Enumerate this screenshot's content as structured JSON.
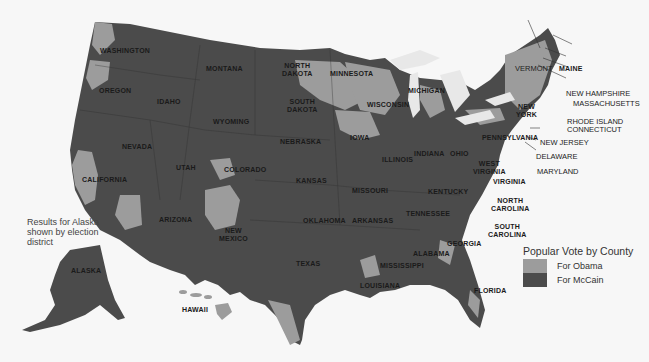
{
  "map": {
    "title": "Popular Vote by County",
    "colors": {
      "obama": "#9c9c9c",
      "mccain": "#4b4b4b",
      "water": "#f7f7f7",
      "lakes": "#e6e6e6"
    },
    "legend": {
      "title": "Popular Vote by County",
      "items": [
        {
          "label": "For Obama",
          "color": "#9c9c9c"
        },
        {
          "label": "For McCain",
          "color": "#4b4b4b"
        }
      ]
    },
    "alaska_note": "Results for Alaska shown by election district",
    "states": [
      "WASHINGTON",
      "OREGON",
      "CALIFORNIA",
      "NEVADA",
      "IDAHO",
      "MONTANA",
      "WYOMING",
      "UTAH",
      "ARIZONA",
      "COLORADO",
      "NEW\nMEXICO",
      "NORTH\nDAKOTA",
      "SOUTH\nDAKOTA",
      "NEBRASKA",
      "KANSAS",
      "OKLAHOMA",
      "TEXAS",
      "MINNESOTA",
      "IOWA",
      "MISSOURI",
      "ARKANSAS",
      "LOUISIANA",
      "WISCONSIN",
      "ILLINOIS",
      "MICHIGAN",
      "INDIANA",
      "OHIO",
      "KENTUCKY",
      "TENNESSEE",
      "MISSISSIPPI",
      "ALABAMA",
      "GEORGIA",
      "FLORIDA",
      "SOUTH\nCAROLINA",
      "NORTH\nCAROLINA",
      "VIRGINIA",
      "WEST\nVIRGINIA",
      "PENNSYLVANIA",
      "NEW\nYORK",
      "MAINE",
      "ALASKA",
      "HAWAII"
    ],
    "callouts": [
      "VERMONT",
      "NEW HAMPSHIRE",
      "MASSACHUSETTS",
      "RHODE ISLAND",
      "CONNECTICUT",
      "NEW JERSEY",
      "DELAWARE",
      "MARYLAND"
    ]
  }
}
